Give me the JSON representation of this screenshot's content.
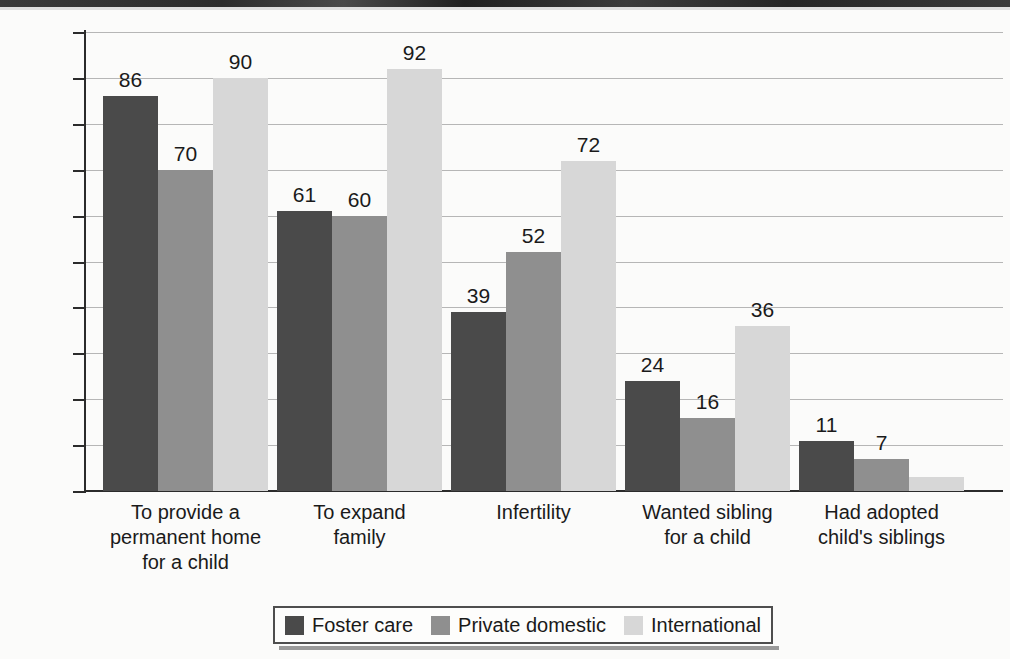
{
  "chart_data": {
    "type": "bar",
    "title": "",
    "subtitle": "",
    "xlabel": "",
    "ylabel": "",
    "ylim": [
      0,
      100
    ],
    "grid": true,
    "legend_position": "bottom",
    "value_suffix": "%",
    "categories": [
      "To provide a\npermanent home\nfor a child",
      "To expand\nfamily",
      "Infertility",
      "Wanted sibling\nfor a child",
      "Had adopted\nchild's siblings"
    ],
    "ytick_labels": [
      "0%",
      "10%",
      "20%",
      "30%",
      "40%",
      "50%",
      "60%",
      "70%",
      "80%",
      "90%",
      "100%"
    ],
    "ytick_values": [
      0,
      10,
      20,
      30,
      40,
      50,
      60,
      70,
      80,
      90,
      100
    ],
    "series": [
      {
        "name": "Foster care",
        "color": "#4a4a4a",
        "values": [
          86,
          61,
          39,
          24,
          11
        ],
        "labels": [
          "86",
          "61",
          "39",
          "24",
          "11"
        ]
      },
      {
        "name": "Private domestic",
        "color": "#8f8f8f",
        "values": [
          70,
          60,
          52,
          16,
          7
        ],
        "labels": [
          "70",
          "60",
          "52",
          "16",
          "7"
        ]
      },
      {
        "name": "International",
        "color": "#d7d7d7",
        "values": [
          90,
          92,
          72,
          36,
          3
        ],
        "labels": [
          "90",
          "92",
          "72",
          "36",
          ""
        ]
      }
    ]
  }
}
